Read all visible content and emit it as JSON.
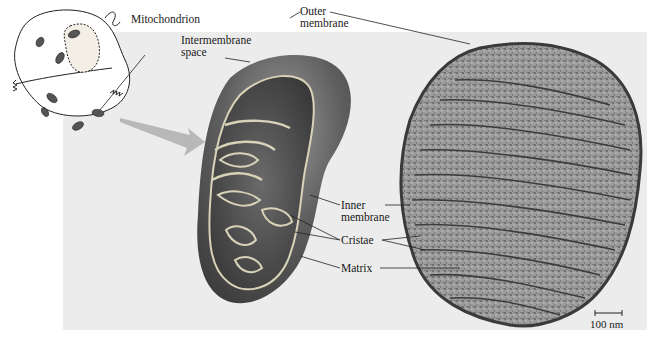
{
  "figure": {
    "type": "labeled-biology-diagram",
    "panels": [
      "cell-sketch",
      "3d-cutaway-illustration",
      "electron-micrograph"
    ]
  },
  "labels": {
    "mitochondrion": "Mitochondrion",
    "intermembrane_line1": "Intermembrane",
    "intermembrane_line2": "space",
    "outer_line1": "Outer",
    "outer_line2": "membrane",
    "inner_line1": "Inner",
    "inner_line2": "membrane",
    "cristae": "Cristae",
    "matrix": "Matrix"
  },
  "scale_bar": {
    "label": "100 nm"
  },
  "colors": {
    "background_panel": "#ececec",
    "membrane_highlight": "#d8d2b8",
    "mito_body": "#5a5a5a",
    "arrow": "#b8b8b8",
    "micrograph": "#8a8a8a"
  }
}
